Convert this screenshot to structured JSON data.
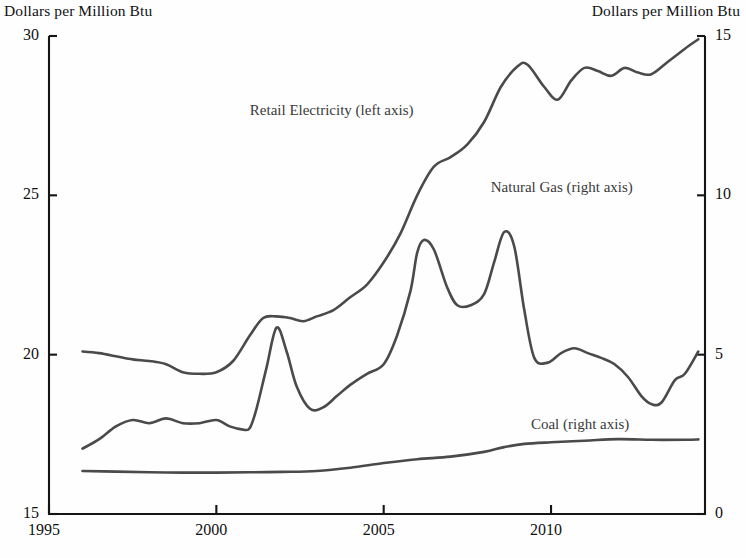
{
  "chart_data": {
    "type": "line",
    "title": "",
    "axis_title_left": "Dollars per Million Btu",
    "axis_title_right": "Dollars per Million Btu",
    "xlabel": "",
    "ylabel": "Dollars per Million Btu",
    "ylabel_right": "Dollars per Million Btu",
    "xlim": [
      1995,
      2014.6
    ],
    "ylim_left": [
      15,
      30
    ],
    "ylim_right": [
      0,
      15
    ],
    "xticks": [
      1995,
      2000,
      2005,
      2010
    ],
    "xtick_labels": [
      "1995",
      "2000",
      "2005",
      "2010"
    ],
    "yticks_left": [
      15,
      20,
      25,
      30
    ],
    "ytick_labels_left": [
      "15",
      "20",
      "25",
      "30"
    ],
    "yticks_right": [
      0,
      5,
      10,
      15
    ],
    "ytick_labels_right": [
      "0",
      "5",
      "10",
      "15"
    ],
    "grid": false,
    "legend_position": "inline-annotations",
    "line_color": "#4a4a4a",
    "axis_color": "#151515",
    "series": [
      {
        "name": "Retail Electricity (left axis)",
        "axis": "left",
        "label_x": 2001.0,
        "label_y": 27.6,
        "x": [
          1996.0,
          1996.5,
          1997.0,
          1997.5,
          1998.0,
          1998.5,
          1999.0,
          1999.5,
          2000.0,
          2000.5,
          2001.0,
          2001.4,
          2001.8,
          2002.2,
          2002.6,
          2003.0,
          2003.5,
          2004.0,
          2004.5,
          2005.0,
          2005.5,
          2006.0,
          2006.5,
          2007.0,
          2007.5,
          2008.0,
          2008.5,
          2009.0,
          2009.3,
          2009.8,
          2010.2,
          2010.6,
          2011.0,
          2011.4,
          2011.8,
          2012.2,
          2012.6,
          2013.0,
          2013.5,
          2014.0,
          2014.4
        ],
        "y": [
          20.1,
          20.05,
          19.95,
          19.85,
          19.8,
          19.7,
          19.45,
          19.4,
          19.45,
          19.8,
          20.6,
          21.15,
          21.2,
          21.15,
          21.05,
          21.2,
          21.4,
          21.8,
          22.2,
          22.9,
          23.8,
          25.0,
          25.9,
          26.2,
          26.6,
          27.3,
          28.4,
          29.05,
          29.1,
          28.4,
          28.0,
          28.6,
          29.0,
          28.9,
          28.75,
          29.0,
          28.85,
          28.8,
          29.2,
          29.6,
          29.9
        ]
      },
      {
        "name": "Natural Gas (right axis)",
        "axis": "right",
        "label_x": 2008.2,
        "label_y": 10.2,
        "x": [
          1996.0,
          1996.5,
          1997.0,
          1997.5,
          1998.0,
          1998.5,
          1999.0,
          1999.5,
          2000.0,
          2000.4,
          2000.8,
          2001.0,
          2001.2,
          2001.5,
          2001.8,
          2002.1,
          2002.4,
          2002.8,
          2003.2,
          2003.6,
          2004.0,
          2004.5,
          2005.0,
          2005.4,
          2005.8,
          2006.0,
          2006.2,
          2006.5,
          2006.9,
          2007.2,
          2007.6,
          2008.0,
          2008.3,
          2008.6,
          2008.9,
          2009.2,
          2009.5,
          2009.9,
          2010.3,
          2010.7,
          2011.1,
          2011.5,
          2011.9,
          2012.3,
          2012.7,
          2013.0,
          2013.3,
          2013.7,
          2014.0,
          2014.4
        ],
        "y": [
          2.05,
          2.35,
          2.75,
          2.95,
          2.85,
          3.0,
          2.85,
          2.85,
          2.95,
          2.75,
          2.65,
          2.7,
          3.3,
          4.6,
          5.85,
          5.1,
          4.0,
          3.3,
          3.35,
          3.7,
          4.05,
          4.4,
          4.7,
          5.6,
          7.0,
          8.2,
          8.6,
          8.3,
          7.1,
          6.55,
          6.55,
          6.9,
          7.9,
          8.85,
          8.4,
          6.4,
          4.9,
          4.75,
          5.05,
          5.2,
          5.05,
          4.9,
          4.7,
          4.3,
          3.7,
          3.45,
          3.5,
          4.2,
          4.4,
          5.1
        ]
      },
      {
        "name": "Coal (right axis)",
        "axis": "right",
        "label_x": 2009.4,
        "label_y": 2.75,
        "x": [
          1996.0,
          1997.0,
          1998.0,
          1999.0,
          2000.0,
          2001.0,
          2002.0,
          2003.0,
          2004.0,
          2005.0,
          2006.0,
          2007.0,
          2008.0,
          2008.6,
          2009.2,
          2010.0,
          2011.0,
          2012.0,
          2013.0,
          2014.0,
          2014.4
        ],
        "y": [
          1.35,
          1.33,
          1.31,
          1.3,
          1.3,
          1.31,
          1.32,
          1.35,
          1.45,
          1.6,
          1.72,
          1.8,
          1.95,
          2.1,
          2.2,
          2.25,
          2.3,
          2.35,
          2.33,
          2.33,
          2.34
        ]
      }
    ],
    "note": ""
  },
  "labels": {
    "title_left": "Dollars per Million Btu",
    "title_right": "Dollars per Million Btu",
    "y_left": [
      "30",
      "25",
      "20",
      "15"
    ],
    "y_right": [
      "15",
      "10",
      "5",
      "0"
    ],
    "x": [
      "1995",
      "2000",
      "2005",
      "2010"
    ],
    "series": [
      "Retail Electricity (left axis)",
      "Natural Gas (right axis)",
      "Coal (right axis)"
    ]
  }
}
